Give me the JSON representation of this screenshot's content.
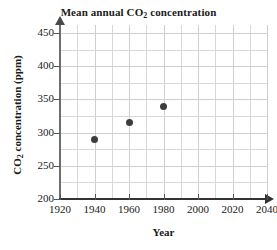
{
  "chart_data": {
    "type": "scatter",
    "title": "Mean annual CO2 concentration",
    "title_parts": {
      "before": "Mean annual CO",
      "sub": "2",
      "after": " concentration"
    },
    "xlabel": "Year",
    "ylabel": "CO2 concentration (ppm)",
    "ylabel_parts": {
      "before": "CO",
      "sub": "2",
      "after": " concentration (ppm)"
    },
    "x": [
      1940,
      1960,
      1980
    ],
    "values": [
      290,
      315,
      340
    ],
    "points": [
      {
        "year": 1940,
        "concentration": 290
      },
      {
        "year": 1960,
        "concentration": 315
      },
      {
        "year": 1980,
        "concentration": 340
      }
    ],
    "xlim": [
      1920,
      2040
    ],
    "ylim": [
      200,
      462
    ],
    "xticks": [
      1920,
      1940,
      1960,
      1980,
      2000,
      2020,
      2040
    ],
    "yticks": [
      200,
      250,
      300,
      350,
      400,
      450
    ],
    "x_minor_step": 10,
    "y_minor_step": 25,
    "grid": true,
    "legend": "none",
    "point_color": "#3d3d3d",
    "grid_color": "#d8d8d8",
    "axis_color": "#4a4a4a"
  }
}
